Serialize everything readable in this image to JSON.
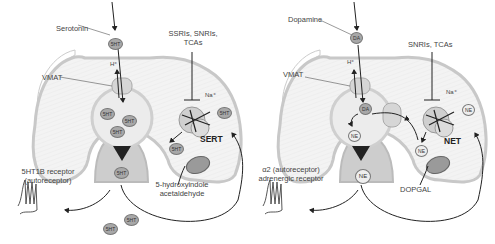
{
  "left_panel": {
    "neurotransmitter_label": "Serotonin",
    "drug_label_line1": "SSRIs, SNRIs,",
    "drug_label_line2": "TCAs",
    "vmat_label": "VMAT",
    "proton_label": "H⁺",
    "sodium_label": "Na⁺",
    "transporter_label": "SERT",
    "receptor_label_line1": "5HT1B receptor",
    "receptor_label_line2": "(autoreceptor)",
    "metabolite_line1": "5-hydroxyindole",
    "metabolite_line2": "acetaldehyde",
    "molecule": "5HT"
  },
  "right_panel": {
    "neurotransmitter_label": "Dopamine",
    "drug_label": "SNRIs, TCAs",
    "vmat_label": "VMAT",
    "proton_label": "H⁺",
    "sodium_label": "Na⁺",
    "transporter_label": "NET",
    "receptor_label_line1": "α2 (autoreceptor)",
    "receptor_label_line2": "adrenergic receptor",
    "metabolite": "DOPGAL",
    "precursor_molecule": "DA",
    "molecule": "NE"
  },
  "colors": {
    "terminal_fill": "#f2f2f2",
    "membrane": "#c8c8c8",
    "vesicle_fill": "#e4e4e4",
    "release_zone": "#c9c9c9",
    "arrow": "#222222"
  }
}
